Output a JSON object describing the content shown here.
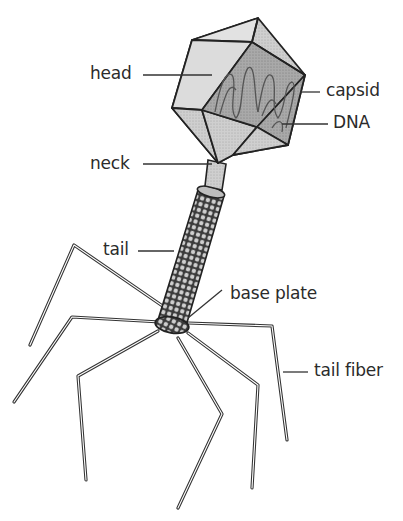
{
  "labels": {
    "head": "head",
    "capsid": "capsid",
    "dna": "DNA",
    "neck": "neck",
    "tail": "tail",
    "base_plate": "base plate",
    "tail_fiber": "tail fiber"
  },
  "colors": {
    "outline": "#2a2a2a",
    "head_fill_light": "#d9d9d9",
    "head_fill_mid": "#c4c4c4",
    "head_fill_dark": "#a8a8a8",
    "tail_fill": "#8a8a8a",
    "leader_line": "#333333",
    "text": "#2b2b2b"
  }
}
